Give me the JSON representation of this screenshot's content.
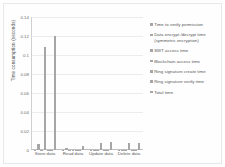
{
  "chart_data": {
    "type": "bar",
    "title": "",
    "xlabel": "",
    "ylabel": "Time consumption (seconds)",
    "ylim": [
      0,
      0.14
    ],
    "grid": true,
    "legend_position": "right",
    "categories": [
      "Store data",
      "Read data",
      "Update data",
      "Delete data"
    ],
    "yticks": [
      "0.14",
      "0.12",
      "0.1",
      "0.08",
      "0.06",
      "0.04",
      "0.02",
      "0"
    ],
    "ytick_values": [
      0.14,
      0.12,
      0.1,
      0.08,
      0.06,
      0.04,
      0.02,
      0
    ],
    "series": [
      {
        "name": "Time to verify permission",
        "values": [
          0.0005,
          0.0005,
          0.0005,
          0.0005
        ]
      },
      {
        "name": "Data encrypt /decrypt time (symmetric encryption)",
        "values": [
          0.0065,
          0.0022,
          0.0005,
          0.0005
        ]
      },
      {
        "name": "SWT access time",
        "values": [
          0.0005,
          0.0005,
          0.0005,
          0.0005
        ]
      },
      {
        "name": "Blockchain access time",
        "values": [
          0.108,
          0.0005,
          0.0075,
          0.0075
        ]
      },
      {
        "name": "Ring signature create time",
        "values": [
          0.0005,
          0.0005,
          0.0005,
          0.0005
        ]
      },
      {
        "name": "Ring signature verify time",
        "values": [
          0.0005,
          0.0005,
          0.0005,
          0.0005
        ]
      },
      {
        "name": "Total time",
        "values": [
          0.12,
          0.0045,
          0.0083,
          0.0075
        ]
      }
    ],
    "colors": {
      "bar": "#a6a6a6",
      "grid": "#ececec",
      "axis": "#bfbfbf",
      "text": "#5a5a5a"
    }
  }
}
